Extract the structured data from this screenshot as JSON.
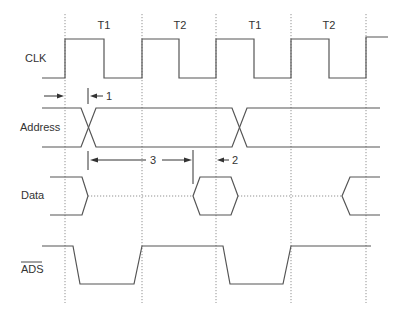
{
  "diagram": {
    "cycle_labels": [
      "T1",
      "T2",
      "T1",
      "T2"
    ],
    "signals": [
      {
        "name": "CLK",
        "label": "CLK",
        "overbar": false
      },
      {
        "name": "Address",
        "label": "Address",
        "overbar": false
      },
      {
        "name": "Data",
        "label": "Data",
        "overbar": false
      },
      {
        "name": "ADS",
        "label": "ADS",
        "overbar": true
      }
    ],
    "annotations": {
      "one": "1",
      "two": "2",
      "three": "3"
    },
    "colors": {
      "signal": "#555555",
      "grid": "#777777",
      "text": "#333333",
      "background": "#ffffff"
    }
  }
}
